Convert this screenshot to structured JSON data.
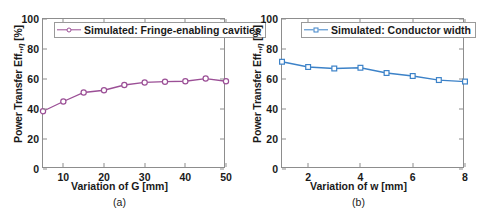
{
  "figure": {
    "panels": [
      {
        "caption": "(a)",
        "xlabel": "Variation of G [mm]",
        "ylabel_pre": "Power Transfer Eff.,",
        "ylabel_eta": "η",
        "ylabel_post": " [%]",
        "legend_label": "Simulated: Fringe-enabling cavities",
        "color": "#9B4F96",
        "marker": "circle"
      },
      {
        "caption": "(b)",
        "xlabel": "Variation of w [mm]",
        "ylabel_pre": "Power Transfer Eff.,",
        "ylabel_eta": "η",
        "ylabel_post": " [%]",
        "legend_label": "Simulated: Conductor width",
        "color": "#3C82C8",
        "marker": "square"
      }
    ]
  },
  "chart_data": [
    {
      "type": "line",
      "title": "(a)",
      "xlabel": "Variation of G [mm]",
      "ylabel": "Power Transfer Eff., η [%]",
      "xlim": [
        5,
        50
      ],
      "ylim": [
        0,
        100
      ],
      "xticks": [
        10,
        20,
        30,
        40,
        50
      ],
      "yticks": [
        0,
        20,
        40,
        60,
        80,
        100
      ],
      "grid": false,
      "legend": [
        "Simulated: Fringe-enabling cavities"
      ],
      "legend_position": "top-left",
      "color": "#9B4F96",
      "marker": "circle",
      "x": [
        5,
        10,
        15,
        20,
        25,
        30,
        35,
        40,
        45,
        50
      ],
      "values": [
        38.5,
        45.0,
        51.0,
        52.5,
        56.0,
        57.7,
        58.2,
        58.5,
        60.3,
        58.5
      ]
    },
    {
      "type": "line",
      "title": "(b)",
      "xlabel": "Variation of w [mm]",
      "ylabel": "Power Transfer Eff., η [%]",
      "xlim": [
        1,
        8
      ],
      "ylim": [
        0,
        100
      ],
      "xticks": [
        2,
        4,
        6,
        8
      ],
      "yticks": [
        0,
        20,
        40,
        60,
        80,
        100
      ],
      "grid": false,
      "legend": [
        "Simulated: Conductor width"
      ],
      "legend_position": "top-right",
      "color": "#3C82C8",
      "marker": "square",
      "x": [
        1,
        2,
        3,
        4,
        5,
        6,
        7,
        8
      ],
      "values": [
        71.5,
        68.0,
        67.0,
        67.5,
        64.0,
        62.0,
        59.3,
        58.3
      ]
    }
  ]
}
